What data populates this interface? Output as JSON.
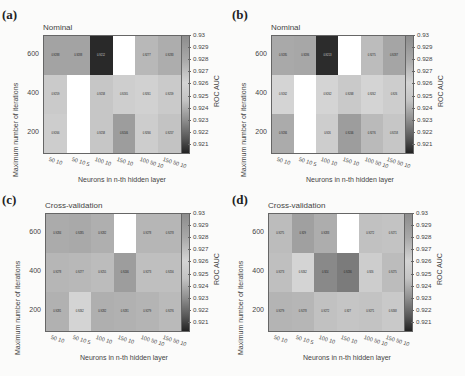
{
  "figure": {
    "colorbar_label": "ROC AUC",
    "colorbar_ticks": [
      "0.93",
      "0.929",
      "0.928",
      "0.927",
      "0.926",
      "0.925",
      "0.924",
      "0.923",
      "0.922",
      "0.921"
    ],
    "xlabel": "Neurons in n-th hidden layer",
    "ylabel": "Maximum number of iterations",
    "xticks": [
      "50 10",
      "50 10 5",
      "100 10",
      "150 10",
      "100 50 10",
      "150 50 10"
    ],
    "yticks": [
      "600",
      "400",
      "200"
    ]
  },
  "panels": [
    {
      "letter": "(a)",
      "subtitle": "Nominal"
    },
    {
      "letter": "(b)",
      "subtitle": "Nominal"
    },
    {
      "letter": "(c)",
      "subtitle": "Cross-validation"
    },
    {
      "letter": "(d)",
      "subtitle": "Cross-validation"
    }
  ],
  "chart_data": [
    {
      "type": "heatmap",
      "title": "(a) Nominal",
      "xlabel": "Neurons in n-th hidden layer",
      "ylabel": "Maximum number of iterations",
      "x": [
        "50 10",
        "50 10 5",
        "100 10",
        "150 10",
        "100 50 10",
        "150 50 10"
      ],
      "y": [
        "600",
        "400",
        "200"
      ],
      "values": [
        [
          0.9288,
          0.9288,
          0.9212,
          null,
          0.9277,
          0.9283
        ],
        [
          0.9259,
          null,
          0.9258,
          0.9265,
          0.9261,
          0.9259
        ],
        [
          0.9266,
          null,
          0.9258,
          0.9246,
          0.9266,
          0.9257
        ]
      ],
      "colorbar_label": "ROC AUC",
      "zlim": [
        0.921,
        0.93
      ]
    },
    {
      "type": "heatmap",
      "title": "(b) Nominal",
      "xlabel": "Neurons in n-th hidden layer",
      "ylabel": "Maximum number of iterations",
      "x": [
        "50 10",
        "50 10 5",
        "100 10",
        "150 10",
        "100 50 10",
        "150 50 10"
      ],
      "y": [
        "600",
        "400",
        "200"
      ],
      "values": [
        [
          0.9285,
          0.9286,
          0.9213,
          null,
          0.9275,
          0.9287
        ],
        [
          0.9262,
          null,
          0.9262,
          0.9268,
          0.9262,
          0.926
        ],
        [
          0.9284,
          null,
          0.926,
          0.9246,
          0.9276,
          0.9258
        ]
      ],
      "colorbar_label": "ROC AUC",
      "zlim": [
        0.921,
        0.93
      ]
    },
    {
      "type": "heatmap",
      "title": "(c) Cross-validation",
      "xlabel": "Neurons in n-th hidden layer",
      "ylabel": "Maximum number of iterations",
      "x": [
        "50 10",
        "50 10 5",
        "100 10",
        "150 10",
        "100 50 10",
        "150 50 10"
      ],
      "y": [
        "600",
        "400",
        "200"
      ],
      "values": [
        [
          0.9284,
          0.9285,
          0.9282,
          null,
          0.9278,
          0.9278
        ],
        [
          0.9278,
          0.9277,
          0.9255,
          0.9246,
          0.9273,
          0.9256
        ],
        [
          0.9281,
          0.9262,
          0.9282,
          0.9281,
          0.9279,
          0.9276
        ]
      ],
      "colorbar_label": "ROC AUC",
      "zlim": [
        0.921,
        0.93
      ]
    },
    {
      "type": "heatmap",
      "title": "(d) Cross-validation",
      "xlabel": "Neurons in n-th hidden layer",
      "ylabel": "Maximum number of iterations",
      "x": [
        "50 10",
        "50 10 5",
        "100 10",
        "150 10",
        "100 50 10",
        "150 50 10"
      ],
      "y": [
        "600",
        "400",
        "200"
      ],
      "values": [
        [
          0.9275,
          0.929,
          0.9283,
          null,
          0.9272,
          0.9271
        ],
        [
          0.9273,
          0.9262,
          0.924,
          0.9236,
          0.926,
          0.9275
        ],
        [
          0.9279,
          0.9278,
          0.9272,
          0.927,
          0.9271,
          0.9268
        ]
      ],
      "colorbar_label": "ROC AUC",
      "zlim": [
        0.921,
        0.93
      ]
    }
  ]
}
